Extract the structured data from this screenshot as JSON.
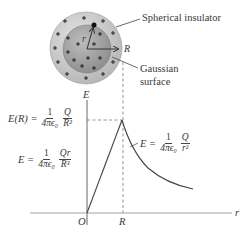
{
  "figure": {
    "sphere_label": "Spherical insulator",
    "gaussian_label_line1": "Gaussian",
    "gaussian_label_line2": "surface",
    "radius_label_R": "R",
    "radius_label_r": "r",
    "charge_symbol": "+",
    "colors": {
      "outer_sphere": "#c9c9c9",
      "inner_sphere": "#a8a8a8",
      "line": "#444444",
      "dashed": "#777777"
    }
  },
  "graph": {
    "y_axis_label": "E",
    "x_axis_label": "r",
    "origin_label": "O",
    "R_tick_label": "R",
    "eq_peak": {
      "lhs": "E(R) =",
      "coef_num": "1",
      "coef_den": "4πϵ₀",
      "frac_num": "Q",
      "frac_den": "R²"
    },
    "eq_inside": {
      "lhs": "E =",
      "coef_num": "1",
      "coef_den": "4πϵ₀",
      "frac_num": "Qr",
      "frac_den": "R³"
    },
    "eq_outside": {
      "lhs": "E =",
      "coef_num": "1",
      "coef_den": "4πϵ₀",
      "frac_num": "Q",
      "frac_den": "r²"
    }
  }
}
